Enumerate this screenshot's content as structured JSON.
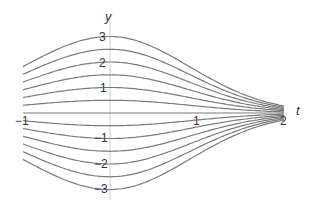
{
  "chart_data": {
    "type": "line",
    "title": "",
    "xlabel": "t",
    "ylabel": "y",
    "xlim": [
      -1,
      2
    ],
    "ylim": [
      -3,
      3
    ],
    "x_ticks": [
      "-1",
      "1",
      "2"
    ],
    "y_ticks": [
      "3",
      "2",
      "1",
      "-1",
      "-2",
      "-3"
    ],
    "grid": false,
    "legend": "none",
    "series": [
      {
        "name": "C=3",
        "y_at_t0": 3
      },
      {
        "name": "C=2.5",
        "y_at_t0": 2.5
      },
      {
        "name": "C=2",
        "y_at_t0": 2
      },
      {
        "name": "C=1.5",
        "y_at_t0": 1.5
      },
      {
        "name": "C=1",
        "y_at_t0": 1
      },
      {
        "name": "C=0.5",
        "y_at_t0": 0.5
      },
      {
        "name": "C=0",
        "y_at_t0": 0
      },
      {
        "name": "C=-0.5",
        "y_at_t0": -0.5
      },
      {
        "name": "C=-1",
        "y_at_t0": -1
      },
      {
        "name": "C=-1.5",
        "y_at_t0": -1.5
      },
      {
        "name": "C=-2",
        "y_at_t0": -2
      },
      {
        "name": "C=-2.5",
        "y_at_t0": -2.5
      },
      {
        "name": "C=-3",
        "y_at_t0": -3
      }
    ],
    "curve_color": "#7a7a7a",
    "axis_color": "#c8c8c8"
  },
  "labels": {
    "y_axis": "y",
    "t_axis": "t",
    "y3": "3",
    "y2": "2",
    "y1": "1",
    "ym1": "−1",
    "ym2": "−2",
    "ym3": "−3",
    "tm1": "−1",
    "t1": "1",
    "t2": "2"
  }
}
